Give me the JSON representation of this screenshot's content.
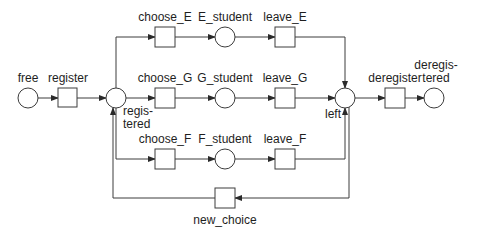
{
  "diagram": {
    "type": "petri-net",
    "colors": {
      "stroke": "#3c3c3c",
      "text": "#1e1e1e",
      "background": "#ffffff"
    },
    "places": {
      "free": {
        "label": "free"
      },
      "registered": {
        "label_line1": "regis-",
        "label_line2": "tered"
      },
      "E_student": {
        "label": "E_student"
      },
      "G_student": {
        "label": "G_student"
      },
      "F_student": {
        "label": "F_student"
      },
      "left": {
        "label": "left"
      },
      "deregistered": {
        "label_line1": "deregis-",
        "label_line2": "tered"
      }
    },
    "transitions": {
      "register": {
        "label": "register"
      },
      "choose_E": {
        "label": "choose_E"
      },
      "choose_G": {
        "label": "choose_G"
      },
      "choose_F": {
        "label": "choose_F"
      },
      "leave_E": {
        "label": "leave_E"
      },
      "leave_G": {
        "label": "leave_G"
      },
      "leave_F": {
        "label": "leave_F"
      },
      "deregister": {
        "label": "deregister"
      },
      "new_choice": {
        "label": "new_choice"
      }
    },
    "arcs": [
      [
        "free",
        "register"
      ],
      [
        "register",
        "registered"
      ],
      [
        "registered",
        "choose_E"
      ],
      [
        "registered",
        "choose_G"
      ],
      [
        "registered",
        "choose_F"
      ],
      [
        "choose_E",
        "E_student"
      ],
      [
        "choose_G",
        "G_student"
      ],
      [
        "choose_F",
        "F_student"
      ],
      [
        "E_student",
        "leave_E"
      ],
      [
        "G_student",
        "leave_G"
      ],
      [
        "F_student",
        "leave_F"
      ],
      [
        "leave_E",
        "left"
      ],
      [
        "leave_G",
        "left"
      ],
      [
        "leave_F",
        "left"
      ],
      [
        "left",
        "new_choice"
      ],
      [
        "new_choice",
        "registered"
      ],
      [
        "left",
        "deregister"
      ],
      [
        "deregister",
        "deregistered"
      ]
    ]
  }
}
